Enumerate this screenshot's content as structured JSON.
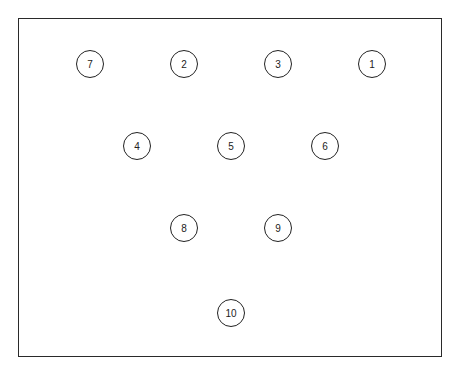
{
  "diagram": {
    "pins": [
      {
        "label": "7",
        "x": 90,
        "y": 64
      },
      {
        "label": "2",
        "x": 184,
        "y": 64
      },
      {
        "label": "3",
        "x": 278,
        "y": 64
      },
      {
        "label": "1",
        "x": 372,
        "y": 64
      },
      {
        "label": "4",
        "x": 137,
        "y": 146
      },
      {
        "label": "5",
        "x": 231,
        "y": 146
      },
      {
        "label": "6",
        "x": 325,
        "y": 146
      },
      {
        "label": "8",
        "x": 184,
        "y": 228
      },
      {
        "label": "9",
        "x": 278,
        "y": 228
      },
      {
        "label": "10",
        "x": 231,
        "y": 313
      }
    ]
  }
}
